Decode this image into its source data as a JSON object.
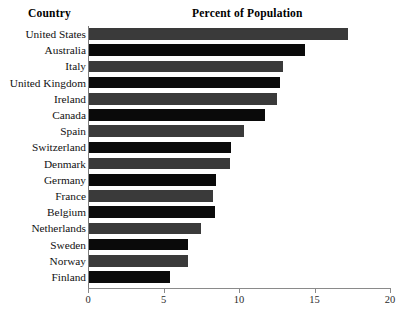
{
  "header": {
    "country_label": "Country",
    "value_label": "Percent of Population"
  },
  "chart_data": {
    "type": "bar",
    "orientation": "horizontal",
    "title": "Percent of Population",
    "xlabel": "Percent of Population",
    "ylabel": "Country",
    "xlim": [
      0,
      20
    ],
    "xticks": [
      0,
      5,
      10,
      15,
      20
    ],
    "xtick_labels": [
      "0",
      "5",
      "10",
      "15",
      "20"
    ],
    "grid": false,
    "legend": false,
    "categories": [
      "United States",
      "Australia",
      "Italy",
      "United Kingdom",
      "Ireland",
      "Canada",
      "Spain",
      "Switzerland",
      "Denmark",
      "Germany",
      "France",
      "Belgium",
      "Netherlands",
      "Sweden",
      "Norway",
      "Finland"
    ],
    "values": [
      17.2,
      14.4,
      12.9,
      12.7,
      12.5,
      11.7,
      10.3,
      9.5,
      9.4,
      8.5,
      8.3,
      8.4,
      7.5,
      6.6,
      6.6,
      5.4
    ],
    "bar_colors": [
      "#3a3a3a",
      "#0a0a0a",
      "#3a3a3a",
      "#0a0a0a",
      "#3a3a3a",
      "#0a0a0a",
      "#3a3a3a",
      "#0a0a0a",
      "#3a3a3a",
      "#0a0a0a",
      "#3a3a3a",
      "#0a0a0a",
      "#3a3a3a",
      "#0a0a0a",
      "#3a3a3a",
      "#0a0a0a"
    ],
    "colors": {
      "gray_bar": "#3a3a3a",
      "black_bar": "#0a0a0a",
      "axis": "#8a8a8a",
      "background": "#ffffff"
    }
  }
}
